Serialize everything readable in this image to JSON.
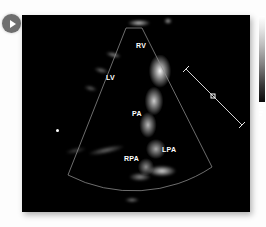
{
  "viewer": {
    "play_button": "play-icon",
    "panel_name": "echocardiogram-image"
  },
  "ultrasound": {
    "modality": "2D echocardiography",
    "view": "parasternal short-axis / great vessels",
    "labels": [
      {
        "text": "RV",
        "x": 114,
        "y": 30,
        "name": "label-rv"
      },
      {
        "text": "LV",
        "x": 84,
        "y": 62,
        "name": "label-lv"
      },
      {
        "text": "PA",
        "x": 110,
        "y": 98,
        "name": "label-pa"
      },
      {
        "text": "RPA",
        "x": 104,
        "y": 143,
        "name": "label-rpa"
      },
      {
        "text": "LPA",
        "x": 140,
        "y": 134,
        "name": "label-lpa"
      }
    ],
    "sector": {
      "apex_x": 112,
      "apex_y": 12,
      "outline_color": "#9a9a9a"
    },
    "caliper": {
      "name": "measurement-caliper",
      "color": "#d8d8d8",
      "marker": "+"
    },
    "gray_bar": {
      "name": "grayscale-reference-bar",
      "top_color": "#ffffff",
      "bottom_color": "#000000"
    }
  },
  "colors": {
    "page_background": "#fdfdfd",
    "panel_background": "#000000",
    "play_button": "#6e6e6e",
    "label_text": "#ffffff"
  }
}
